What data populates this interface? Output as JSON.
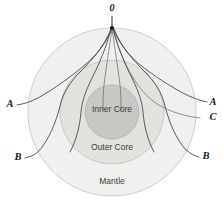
{
  "figure": {
    "source_label": "0",
    "background_color": "#ffffff"
  },
  "layers": [
    {
      "id": "mantle",
      "label": "Mantle",
      "fill": "#f0f0ee",
      "stroke": "#c9c9c6",
      "cx": 112,
      "cy": 112,
      "r": 84,
      "label_x": 112,
      "label_y": 182
    },
    {
      "id": "outer-core",
      "label": "Outer Core",
      "fill": "#e2e2df",
      "stroke": "#c4c4c0",
      "cx": 112,
      "cy": 112,
      "r": 52,
      "label_x": 112,
      "label_y": 148
    },
    {
      "id": "inner-core",
      "label": "Inner Core",
      "fill": "#c8c8c5",
      "stroke": "#b4b4b0",
      "cx": 112,
      "cy": 112,
      "r": 27,
      "label_x": 112,
      "label_y": 110
    }
  ],
  "source": {
    "label": "0",
    "label_x": 112,
    "label_y": 9,
    "marker_x": 112,
    "marker_y": 28
  },
  "ray_labels": [
    {
      "id": "a-left",
      "text": "A",
      "x": 10,
      "y": 105
    },
    {
      "id": "a-right",
      "text": "A",
      "x": 213,
      "y": 103
    },
    {
      "id": "c-right",
      "text": "C",
      "x": 213,
      "y": 118
    },
    {
      "id": "b-left",
      "text": "B",
      "x": 18,
      "y": 158
    },
    {
      "id": "b-right",
      "text": "B",
      "x": 206,
      "y": 157
    }
  ],
  "ray_paths": [
    {
      "id": "ray-a-left",
      "label": "A",
      "description": "P wave refracting through mantle, exiting left at A",
      "d": "M 112 29 C 105 45 96 55 86 64 C 72 76 54 89 38 98 C 30 102 24 104 17 105"
    },
    {
      "id": "ray-a-right",
      "label": "A",
      "description": "P wave refracting through mantle, exiting right at A",
      "d": "M 113 29 C 120 45 129 55 139 64 C 153 75 172 88 189 96 C 196 99 202 101 207 102"
    },
    {
      "id": "ray-b-left",
      "label": "B",
      "description": "P wave refracted at core-mantle boundary, exiting left at B",
      "d": "M 111 29 C 104 47 92 60 80 72 C 70 82 63 93 60 106 C 56 122 49 140 38 152 C 33 156 29 157 25 158"
    },
    {
      "id": "ray-b-right",
      "label": "B",
      "description": "P wave refracted at core-mantle boundary, exiting right at B",
      "d": "M 114 29 C 121 47 133 60 145 72 C 155 82 162 93 165 106 C 169 122 176 139 186 150 C 191 154 195 156 199 157"
    },
    {
      "id": "ray-c-right",
      "label": "C",
      "description": "PKIKP wave transmitted through inner core, exiting right at C",
      "d": "M 113 29 C 118 48 124 62 132 76 C 139 88 147 97 157 104 C 170 112 188 117 200 118"
    },
    {
      "id": "ray-core-left",
      "label": "",
      "description": "Ray grazing inner core on left side",
      "d": "M 111 29 C 106 48 100 62 93 76 C 87 88 82 100 81 112 C 80 126 76 141 70 152"
    },
    {
      "id": "ray-core-right",
      "label": "",
      "description": "Ray grazing inner core on right side",
      "d": "M 113 29 C 118 48 124 62 131 76 C 137 88 142 100 143 112 C 144 126 148 141 154 152"
    },
    {
      "id": "ray-center-left",
      "label": "",
      "description": "Near-vertical ray descending left of source into inner core",
      "d": "M 112 29 C 109 50 106 68 104 85 C 103 95 103 102 103 110"
    },
    {
      "id": "ray-center-right",
      "label": "",
      "description": "Near-vertical ray descending right of source into inner core",
      "d": "M 112 29 C 115 50 118 68 120 85 C 121 95 121 102 121 110"
    }
  ]
}
